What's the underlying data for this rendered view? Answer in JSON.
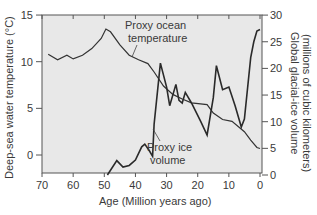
{
  "chart_data": {
    "type": "line",
    "title": "",
    "xlabel": "Age (Million years ago)",
    "ylabel_left": "Deep-sea water temperature (°C)",
    "ylabel_right_line1": "Global glacial-ice volume",
    "ylabel_right_line2": "(millions of cubic kilometers)",
    "xlim": [
      70,
      0
    ],
    "ylim_left": [
      -2,
      15
    ],
    "ylim_right": [
      0,
      30
    ],
    "x_ticks": [
      "70",
      "60",
      "50",
      "40",
      "30",
      "20",
      "10",
      "0"
    ],
    "y_ticks_left": [
      "15",
      "10",
      "5",
      "0"
    ],
    "y_ticks_right": [
      "30",
      "25",
      "20",
      "15",
      "10",
      "5",
      "0"
    ],
    "grid": false,
    "legend": "none (inline annotations)",
    "annotations": {
      "temperature": [
        "Proxy ocean",
        "temperature"
      ],
      "ice": [
        "Proxy ice",
        "volume"
      ]
    },
    "series": [
      {
        "name": "Proxy ocean temperature",
        "axis": "left",
        "x": [
          68,
          65,
          62,
          60,
          57,
          54,
          51,
          49.5,
          48,
          45,
          42,
          39,
          36,
          34,
          31,
          28,
          25,
          22,
          17,
          15,
          12,
          9,
          5,
          3,
          1,
          0
        ],
        "y": [
          10.8,
          10.2,
          10.7,
          10.3,
          10.7,
          11.4,
          12.5,
          13.5,
          13.2,
          11.8,
          10.7,
          10.2,
          9.8,
          8.9,
          7.4,
          6.5,
          6.0,
          5.6,
          5.4,
          4.5,
          3.8,
          3.6,
          2.5,
          1.6,
          0.8,
          0.7
        ]
      },
      {
        "name": "Proxy ice volume",
        "axis": "right",
        "x": [
          49,
          46,
          44,
          42,
          40,
          38,
          37,
          35.5,
          34.5,
          34,
          32,
          30,
          29,
          27,
          26,
          25,
          24,
          22,
          19,
          17,
          15,
          14,
          12,
          10,
          8,
          6,
          5,
          3,
          2,
          1,
          0
        ],
        "y": [
          0,
          2.7,
          1.5,
          1.8,
          2.8,
          5.3,
          5.8,
          4.5,
          3.5,
          9.5,
          21,
          16.5,
          13,
          17,
          14,
          13.5,
          15.5,
          13.5,
          10,
          7.5,
          14.5,
          20.5,
          16,
          16.5,
          13,
          9,
          10.5,
          22,
          25,
          27,
          27.3
        ]
      }
    ]
  }
}
